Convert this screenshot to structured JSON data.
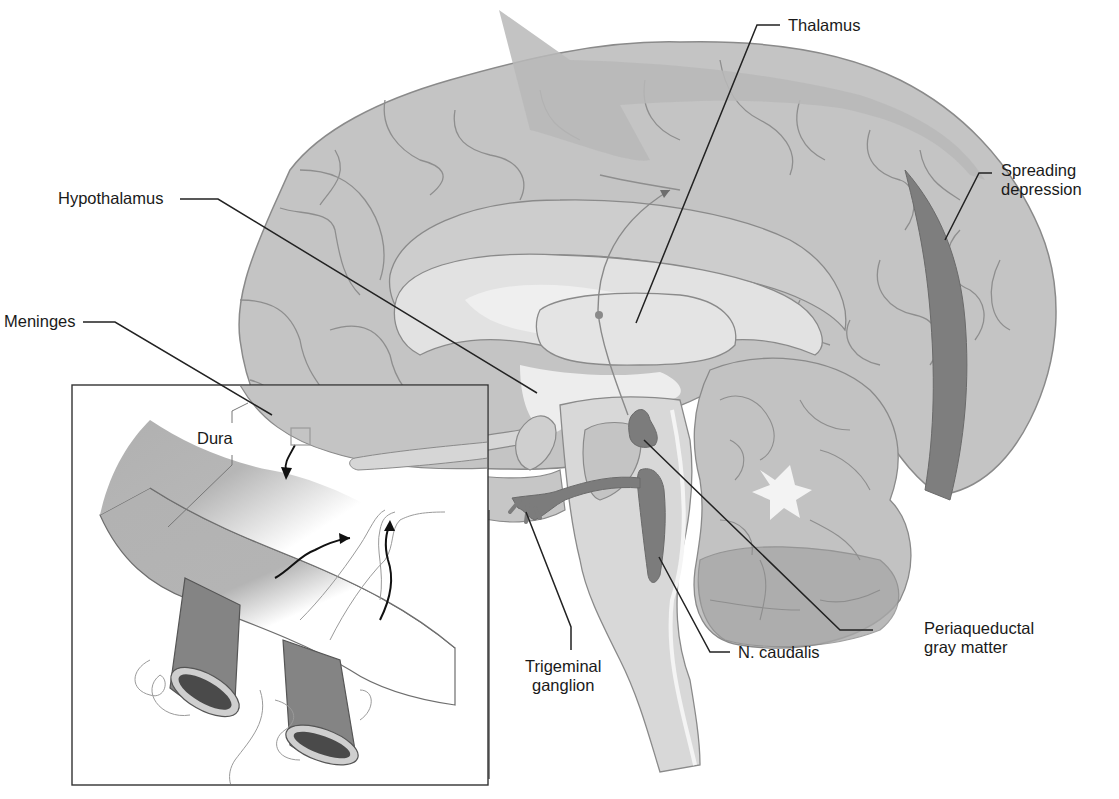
{
  "figure": {
    "colors": {
      "background": "#ffffff",
      "cortex": "#c2c2c2",
      "cortex_outline": "#8a8a8a",
      "white_matter_light": "#dcdcdc",
      "thalamus_fill": "#e6e6e6",
      "ventricle": "#f2f2f2",
      "dark_structure": "#7c7c7c",
      "spreading_wave": "#8c8c8c",
      "wave_light": "#b6b6b6",
      "cerebellum_outer": "#a9a9a9",
      "label_text": "#1a1a1a",
      "leader_line": "#222222",
      "dura": "#9a9a9a",
      "vessel": "#808080",
      "vessel_lumen": "#4a4a4a"
    }
  },
  "labels": {
    "thalamus": "Thalamus",
    "hypothalamus": "Hypothalamus",
    "spreading_depression": [
      "Spreading",
      "depression"
    ],
    "meninges": "Meninges",
    "dura": "Dura",
    "periaqueductal_gray": [
      "Periaqueductal",
      "gray matter"
    ],
    "n_caudalis": "N. caudalis",
    "trigeminal_ganglion": [
      "Trigeminal",
      "ganglion"
    ]
  },
  "inset": {
    "name": "dura-blood-vessel-inset",
    "description": "Magnified view of dura with meningeal blood vessels and trigeminal nerve fibers"
  }
}
